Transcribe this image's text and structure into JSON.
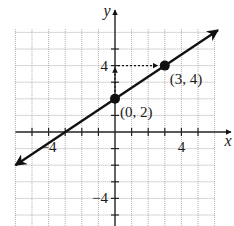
{
  "chart_data": {
    "type": "line",
    "title": "",
    "xlabel": "x",
    "ylabel": "y",
    "xlim": [
      -6,
      6
    ],
    "ylim": [
      -6,
      6
    ],
    "grid": true,
    "grid_style": "dotted",
    "x_tick_values": [
      -5,
      -4,
      -3,
      -2,
      -1,
      1,
      2,
      3,
      4,
      5
    ],
    "y_tick_values": [
      -5,
      -4,
      -3,
      -2,
      -1,
      1,
      2,
      3,
      4,
      5
    ],
    "x_tick_labels": [
      {
        "value": -4,
        "label": "−4"
      },
      {
        "value": 4,
        "label": "4"
      }
    ],
    "y_tick_labels": [
      {
        "value": 4,
        "label": "4"
      },
      {
        "value": -4,
        "label": "−4"
      }
    ],
    "series": [
      {
        "name": "line",
        "equation": "y = (2/3)x + 2",
        "slope": 0.6667,
        "intercept": 2,
        "x_range": [
          -6,
          6.2
        ],
        "arrows": "both",
        "color": "#111111"
      }
    ],
    "points": [
      {
        "x": 0,
        "y": 2,
        "label": "(0, 2)"
      },
      {
        "x": 3,
        "y": 4,
        "label": "(3, 4)"
      }
    ],
    "annotations": [
      {
        "type": "dotted-arrow",
        "from": [
          0,
          4
        ],
        "to": [
          3,
          4
        ],
        "direction": "right"
      },
      {
        "type": "dotted-arrow",
        "from": [
          0,
          2
        ],
        "to": [
          0,
          4
        ],
        "direction": "up"
      }
    ]
  }
}
